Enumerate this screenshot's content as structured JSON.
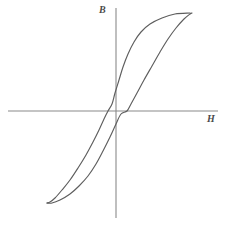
{
  "figure": {
    "background_color": "#ffffff",
    "width": 232,
    "height": 227
  },
  "axes": {
    "x_axis_label": "H",
    "y_axis_label": "B",
    "axis_color": "#8a8a8a",
    "x_axis": {
      "y": 111,
      "x_start": 8,
      "x_end": 218
    },
    "y_axis": {
      "x": 116,
      "y_start": 8,
      "y_end": 218
    }
  },
  "chart_data": {
    "type": "line",
    "title": "",
    "subtitle": "",
    "xlabel": "H",
    "ylabel": "B",
    "grid": false,
    "legend": null,
    "legend_position": "none",
    "annotations": [],
    "curve_color": "#5e5e5e",
    "origin": {
      "x": 116,
      "y": 111
    },
    "xlim": [
      -1.1,
      1.1
    ],
    "ylim": [
      -1.1,
      1.1
    ],
    "x_tick_labels": [],
    "y_tick_labels": [],
    "features": {
      "saturation_upper_tip": {
        "x": 0.78,
        "y": 0.93
      },
      "saturation_lower_tip": {
        "x": -0.64,
        "y": -0.87
      },
      "coercivity_negative": {
        "x": -0.08,
        "y": 0.0
      },
      "coercivity_positive": {
        "x": 0.11,
        "y": 0.0
      },
      "remanence_positive": {
        "x": 0.0,
        "y": 0.13
      },
      "remanence_negative": {
        "x": 0.0,
        "y": -0.12
      }
    },
    "series": [
      {
        "name": "descending-branch",
        "path_points": [
          [
            190,
            13
          ],
          [
            175,
            14
          ],
          [
            162,
            18
          ],
          [
            150,
            24
          ],
          [
            141,
            32
          ],
          [
            134,
            42
          ],
          [
            128,
            54
          ],
          [
            123,
            67
          ],
          [
            119,
            80
          ],
          [
            115,
            93
          ],
          [
            112,
            104
          ],
          [
            108,
            111
          ],
          [
            104,
            119
          ],
          [
            99,
            130
          ],
          [
            93,
            142
          ],
          [
            86,
            155
          ],
          [
            78,
            168
          ],
          [
            70,
            180
          ],
          [
            62,
            190
          ],
          [
            55,
            198
          ],
          [
            50,
            202
          ],
          [
            47,
            203
          ]
        ]
      },
      {
        "name": "ascending-branch",
        "path_points": [
          [
            47,
            203
          ],
          [
            52,
            203
          ],
          [
            60,
            200
          ],
          [
            70,
            194
          ],
          [
            79,
            186
          ],
          [
            88,
            176
          ],
          [
            96,
            164
          ],
          [
            103,
            151
          ],
          [
            110,
            137
          ],
          [
            116,
            124
          ],
          [
            121,
            114
          ],
          [
            127,
            111
          ],
          [
            131,
            104
          ],
          [
            137,
            93
          ],
          [
            144,
            80
          ],
          [
            152,
            66
          ],
          [
            160,
            52
          ],
          [
            168,
            39
          ],
          [
            176,
            28
          ],
          [
            184,
            19
          ],
          [
            190,
            14
          ],
          [
            192,
            13
          ]
        ]
      }
    ]
  }
}
